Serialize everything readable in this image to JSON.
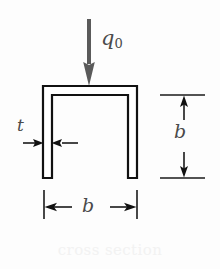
{
  "figure": {
    "caption": "cross section",
    "background_color": "#fdfdfd",
    "outline_color": "#111111",
    "fill_color": "#ffffff",
    "load_arrow_color": "#5a5a5a",
    "dimension_color": "#1a1a1a",
    "label_color": "#4a4a4a",
    "caption_color": "#f2f2f2"
  },
  "labels": {
    "load": "q",
    "load_subscript": "0",
    "thickness": "t",
    "height": "b",
    "width": "b"
  },
  "geometry": {
    "section_type": "channel",
    "orientation": "inverted-U",
    "outer_left_x": 43,
    "outer_right_x": 137,
    "outer_top_y": 86,
    "leg_bottom_y": 178,
    "wall_thickness_px": 9,
    "inner_left_x": 52,
    "inner_right_x": 128,
    "inner_top_y": 95
  },
  "dimensions": {
    "height_dimension": {
      "label": "b",
      "orientation": "vertical",
      "from_y": 95,
      "to_y": 178,
      "line_x": 184,
      "extension_from_x": 160,
      "extension_to_x": 205
    },
    "width_dimension": {
      "label": "b",
      "orientation": "horizontal",
      "from_x": 44,
      "to_x": 137,
      "line_y": 207,
      "extension_from_y": 190,
      "extension_to_y": 219
    },
    "thickness_dimension": {
      "label": "t",
      "orientation": "horizontal",
      "left_arrow_x": 23,
      "right_arrow_x": 78,
      "line_y": 143
    }
  },
  "load": {
    "label": "q0",
    "direction": "downward",
    "arrow_x": 89,
    "shaft_top_y": 19,
    "tip_y": 86
  }
}
